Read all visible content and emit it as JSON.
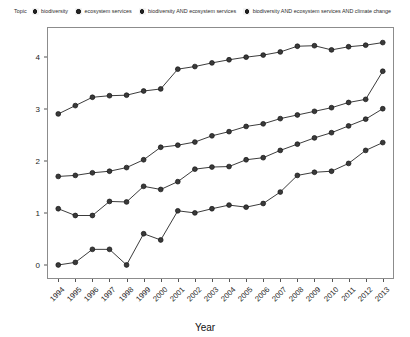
{
  "legend": {
    "title": "Topic",
    "items": [
      {
        "label": "biodiversity",
        "key_icon": "filled-circle-marker",
        "color": "#262626"
      },
      {
        "label": "ecosystem services",
        "key_icon": "filled-circle-marker",
        "color": "#262626"
      },
      {
        "label": "biodiversity AND ecosystem services",
        "key_icon": "filled-circle-marker",
        "color": "#262626"
      },
      {
        "label": "biodiversity AND ecosystem services AND climate change",
        "key_icon": "filled-circle-marker",
        "color": "#262626"
      }
    ]
  },
  "axes": {
    "y_label_main": "log",
    "y_label_sub": "10",
    "y_label_rest": "(Number of articles)",
    "y_ticks": [
      "0",
      "1",
      "2",
      "3",
      "4"
    ],
    "x_label": "Year"
  },
  "chart_data": {
    "type": "line",
    "title": "",
    "xlabel": "Year",
    "ylabel": "log10(Number of articles)",
    "xlim": [
      1993.4,
      2013.6
    ],
    "ylim": [
      -0.25,
      4.55
    ],
    "grid": false,
    "legend_position": "top",
    "marker": "circle",
    "categories": [
      "1994",
      "1995",
      "1996",
      "1997",
      "1998",
      "1999",
      "2000",
      "2001",
      "2002",
      "2003",
      "2004",
      "2005",
      "2006",
      "2007",
      "2008",
      "2009",
      "2010",
      "2011",
      "2012",
      "2013"
    ],
    "x": [
      1994,
      1995,
      1996,
      1997,
      1998,
      1999,
      2000,
      2001,
      2002,
      2003,
      2004,
      2005,
      2006,
      2007,
      2008,
      2009,
      2010,
      2011,
      2012,
      2013
    ],
    "series": [
      {
        "name": "biodiversity",
        "color": "#262626",
        "values": [
          2.9,
          3.06,
          3.22,
          3.25,
          3.26,
          3.34,
          3.38,
          3.76,
          3.81,
          3.88,
          3.94,
          3.99,
          4.03,
          4.09,
          4.2,
          4.21,
          4.13,
          4.19,
          4.22,
          4.27
        ]
      },
      {
        "name": "ecosystem services",
        "color": "#262626",
        "values": [
          1.7,
          1.72,
          1.77,
          1.8,
          1.87,
          2.02,
          2.26,
          2.3,
          2.36,
          2.48,
          2.56,
          2.66,
          2.71,
          2.81,
          2.88,
          2.95,
          3.02,
          3.12,
          3.18,
          3.72
        ]
      },
      {
        "name": "biodiversity AND ecosystem services",
        "color": "#262626",
        "values": [
          1.08,
          0.95,
          0.95,
          1.22,
          1.21,
          1.51,
          1.45,
          1.6,
          1.84,
          1.88,
          1.89,
          2.02,
          2.06,
          2.2,
          2.32,
          2.44,
          2.54,
          2.67,
          2.8,
          3.0
        ]
      },
      {
        "name": "biodiversity AND ecosystem services AND climate change",
        "color": "#262626",
        "values": [
          0.0,
          0.05,
          0.3,
          0.3,
          0.0,
          0.6,
          0.48,
          1.04,
          1.0,
          1.08,
          1.15,
          1.11,
          1.18,
          1.4,
          1.72,
          1.78,
          1.8,
          1.95,
          2.2,
          2.35
        ]
      }
    ]
  }
}
